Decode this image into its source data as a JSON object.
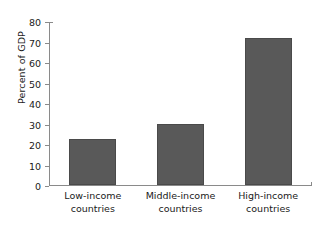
{
  "chart_data": {
    "type": "bar",
    "title": "",
    "subtitle": "",
    "xlabel": "",
    "ylabel": "Percent of GDP",
    "categories": [
      "Low-income countries",
      "Middle-income countries",
      "High-income countries"
    ],
    "category_lines": [
      [
        "Low-income",
        "countries"
      ],
      [
        "Middle-income",
        "countries"
      ],
      [
        "High-income",
        "countries"
      ]
    ],
    "values": [
      22.5,
      30,
      71.5
    ],
    "ylim": [
      0,
      80
    ],
    "yticks": [
      0,
      10,
      20,
      30,
      40,
      50,
      60,
      70,
      80
    ],
    "ytick_labels": [
      "0",
      "10",
      "20",
      "30",
      "40",
      "50",
      "60",
      "70",
      "80"
    ],
    "grid": false,
    "legend": null,
    "legend_position": "none",
    "bar_color": "#595959",
    "bar_edge_color": "#4a4a4a",
    "axis_color": "#8a8a8a",
    "background_color": "#ffffff",
    "text_color": "#1a1a1a"
  }
}
